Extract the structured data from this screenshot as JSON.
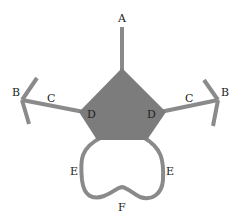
{
  "diagram": {
    "colors": {
      "stroke": "#8a8a8a",
      "fill": "#7c7c7c",
      "label": "#222222",
      "background": "#ffffff"
    },
    "labels": {
      "A": "A",
      "B_left": "B",
      "B_right": "B",
      "C_left": "C",
      "C_right": "C",
      "D_left": "D",
      "D_right": "D",
      "E_left": "E",
      "E_right": "E",
      "F": "F"
    }
  }
}
